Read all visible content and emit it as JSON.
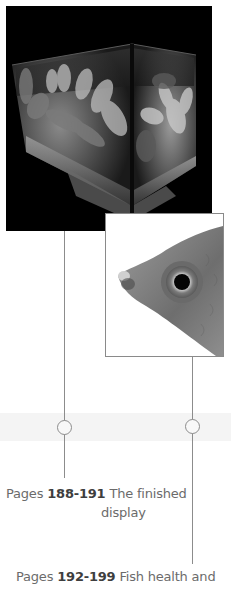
{
  "images": {
    "aquarium": {
      "description": "Finished planted aquarium display, black and white photo"
    },
    "fish": {
      "description": "Close-up of fish head showing eye, black and white photo"
    }
  },
  "captions": [
    {
      "pages_word": "Pages",
      "range": "188-191",
      "title_line1": "The finished",
      "title_line2": "display"
    },
    {
      "pages_word": "Pages",
      "range": "192-199",
      "title_line1": "Fish health and"
    }
  ],
  "colors": {
    "line": "#8c8c8c",
    "caption_text": "#6b6b6b",
    "caption_range": "#3e3e3e"
  }
}
